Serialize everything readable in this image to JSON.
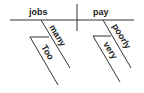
{
  "diagram": {
    "type": "sentence-diagram",
    "subject": "jobs",
    "predicate": "pay",
    "subject_modifiers": [
      {
        "word": "many",
        "modifiers": [
          {
            "word": "Too"
          }
        ]
      }
    ],
    "predicate_modifiers": [
      {
        "word": "poorly",
        "modifiers": [
          {
            "word": "very"
          }
        ]
      }
    ],
    "colors": {
      "line": "#333333",
      "text": "#222222",
      "background": "#ffffff"
    }
  }
}
